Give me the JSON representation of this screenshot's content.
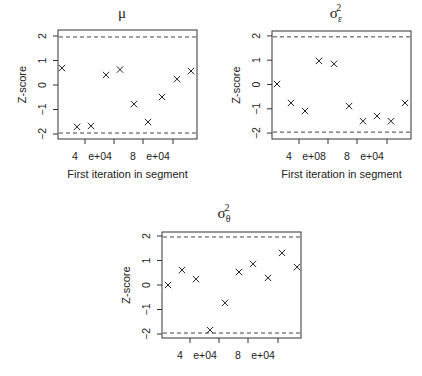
{
  "chart_data": [
    {
      "type": "scatter",
      "title": "μ",
      "title_base": "μ",
      "title_sub": "",
      "title_sup": "",
      "xlabel": "First iteration in segment",
      "ylabel": "Z-score",
      "ylim": [
        -2.2,
        2.2
      ],
      "yticks": [
        -2,
        -1,
        0,
        1,
        2
      ],
      "reference_lines": [
        -1.96,
        1.96
      ],
      "xtick_labels_visible": [
        "4",
        "e+04",
        "8",
        "e+04"
      ],
      "marker": "x",
      "x_index": [
        1,
        2,
        3,
        4,
        5,
        6,
        7,
        8,
        9,
        10
      ],
      "values": [
        0.69,
        -1.71,
        -1.67,
        0.41,
        0.63,
        -0.78,
        -1.51,
        -0.49,
        0.24,
        0.57
      ],
      "box": {
        "left": 58,
        "right": 197,
        "top": 30,
        "bottom": 139
      },
      "px": [
        62,
        77,
        91,
        106,
        120,
        134,
        148,
        162,
        177,
        191
      ],
      "ticks_x": [
        85,
        114,
        143,
        173
      ],
      "y0": 85,
      "yscale": 24.5,
      "title_pos": [
        122,
        18
      ],
      "xlabel_y": 178
    },
    {
      "type": "scatter",
      "title": "σε²",
      "title_base": "σ",
      "title_sub": "ε",
      "title_sup": "2",
      "xlabel": "First iteration in segment",
      "ylabel": "Z-score",
      "ylim": [
        -2.2,
        2.2
      ],
      "yticks": [
        -2,
        -1,
        0,
        1,
        2
      ],
      "reference_lines": [
        -1.96,
        1.96
      ],
      "xtick_labels_visible": [
        "4",
        "e+08",
        "8",
        "e+04"
      ],
      "marker": "x",
      "x_index": [
        1,
        2,
        3,
        4,
        5,
        6,
        7,
        8,
        9,
        10
      ],
      "values": [
        0.02,
        -0.76,
        -1.09,
        0.97,
        0.85,
        -0.89,
        -1.51,
        -1.3,
        -1.51,
        -0.76
      ],
      "box": {
        "left": 272,
        "right": 411,
        "top": 31,
        "bottom": 139
      },
      "px": [
        277,
        291,
        305,
        319,
        334,
        349,
        363,
        377,
        391,
        405
      ],
      "ticks_x": [
        299,
        328,
        357,
        387
      ],
      "y0": 84.5,
      "yscale": 24.3,
      "title_pos": [
        336,
        18
      ],
      "xlabel_y": 178
    },
    {
      "type": "scatter",
      "title": "σθ²",
      "title_base": "σ",
      "title_sub": "θ",
      "title_sup": "2",
      "xlabel": "",
      "ylabel": "Z-score",
      "ylim": [
        -2.2,
        2.2
      ],
      "yticks": [
        -2,
        -1,
        0,
        1,
        2
      ],
      "reference_lines": [
        -1.96,
        1.96
      ],
      "xtick_labels_visible": [
        "4",
        "e+04",
        "8",
        "e+04"
      ],
      "marker": "x",
      "x_index": [
        1,
        2,
        3,
        4,
        5,
        6,
        7,
        8,
        9,
        10
      ],
      "values": [
        0.0,
        0.61,
        0.24,
        -1.84,
        -0.73,
        0.53,
        0.86,
        0.29,
        1.31,
        0.73
      ],
      "box": {
        "left": 162,
        "right": 301,
        "top": 232,
        "bottom": 338
      },
      "px": [
        168,
        182,
        196,
        210,
        225,
        239,
        253,
        268,
        282,
        297
      ],
      "ticks_x": [
        190,
        219,
        248,
        278
      ],
      "y0": 285,
      "yscale": 24.5,
      "title_pos": [
        224,
        218
      ],
      "xlabel_y": null
    }
  ]
}
